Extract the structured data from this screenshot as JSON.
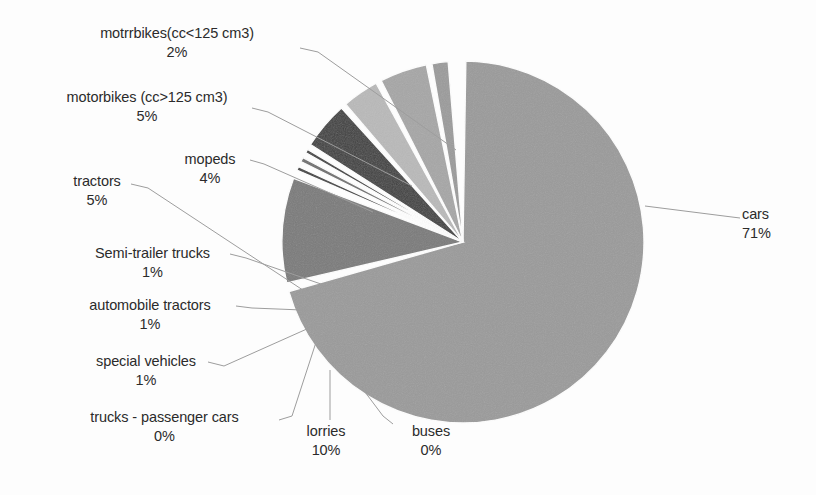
{
  "chart_data": {
    "type": "pie",
    "title": "",
    "categories": [
      "cars",
      "buses",
      "lorries",
      "trucks - passenger cars",
      "special vehicles",
      "automobile tractors",
      "Semi-trailer trucks",
      "tractors",
      "mopeds",
      "motorbikes (cc>125 cm3)",
      "motrrbikes(cc<125 cm3)"
    ],
    "values": [
      71,
      0,
      10,
      0,
      1,
      1,
      1,
      5,
      4,
      5,
      2
    ],
    "value_labels": [
      "71%",
      "0%",
      "10%",
      "0%",
      "1%",
      "1%",
      "1%",
      "5%",
      "4%",
      "5%",
      "2%"
    ],
    "unit": "%",
    "legend": "none",
    "labels_position": "outside-with-leader-lines",
    "start_angle_deg": -90,
    "direction": "clockwise",
    "slice_colors": [
      "#9a9a9a",
      "#ffffff",
      "#7a7a7a",
      "#8f8f8f",
      "#3f3f3f",
      "#6e6e6e",
      "#3f3f3f",
      "#404040",
      "#b9b9b9",
      "#a6a6a6",
      "#9b9b9b"
    ],
    "slice_gap_color": "#ffffff"
  },
  "labels": {
    "motorbikes_small": {
      "name": "motrrbikes(cc<125 cm3)",
      "pct": "2%"
    },
    "motorbikes_large": {
      "name": "motorbikes (cc>125 cm3)",
      "pct": "5%"
    },
    "mopeds": {
      "name": "mopeds",
      "pct": "4%"
    },
    "tractors": {
      "name": "tractors",
      "pct": "5%"
    },
    "semitrailer": {
      "name": "Semi-trailer trucks",
      "pct": "1%"
    },
    "autotractors": {
      "name": "automobile tractors",
      "pct": "1%"
    },
    "special": {
      "name": "special vehicles",
      "pct": "1%"
    },
    "truckspass": {
      "name": "trucks - passenger cars",
      "pct": "0%"
    },
    "lorries": {
      "name": "lorries",
      "pct": "10%"
    },
    "buses": {
      "name": "buses",
      "pct": "0%"
    },
    "cars": {
      "name": "cars",
      "pct": "71%"
    }
  },
  "colors": {
    "background": "#fdfdfd",
    "text": "#2b2b2b",
    "leader_line": "#9d9d9d"
  }
}
